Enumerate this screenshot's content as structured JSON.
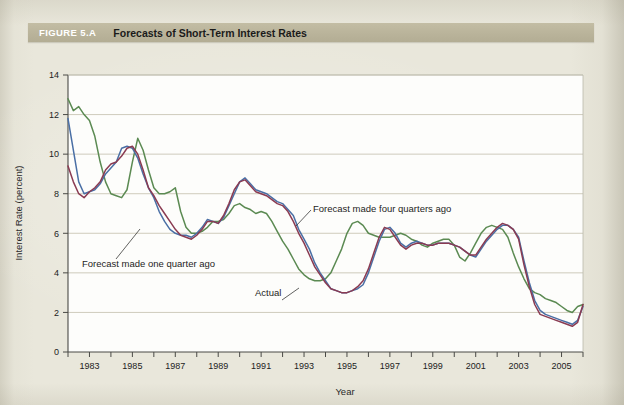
{
  "figure": {
    "number": "FIGURE 5.A",
    "title": "Forecasts of Short-Term Interest Rates"
  },
  "chart_data": {
    "type": "line",
    "title": "Forecasts of Short-Term Interest Rates",
    "xlabel": "Year",
    "ylabel": "Interest Rate (percent)",
    "xlim": [
      1982.0,
      2006.0
    ],
    "ylim": [
      0,
      14
    ],
    "yticks": [
      0,
      2,
      4,
      6,
      8,
      10,
      12,
      14
    ],
    "xticks": [
      1982,
      1983,
      1984,
      1985,
      1986,
      1987,
      1988,
      1989,
      1990,
      1991,
      1992,
      1993,
      1994,
      1995,
      1996,
      1997,
      1998,
      1999,
      2000,
      2001,
      2002,
      2003,
      2004,
      2005,
      2006
    ],
    "xticklabels": [
      "",
      "1983",
      "",
      "1985",
      "",
      "1987",
      "",
      "1989",
      "",
      "1991",
      "",
      "1993",
      "",
      "1995",
      "",
      "1997",
      "",
      "1999",
      "",
      "2001",
      "",
      "2003",
      "",
      "2005",
      ""
    ],
    "grid": "horizontal",
    "legend_position": "inline-annotations",
    "x_start": 1982.0,
    "x_step": 0.25,
    "series": [
      {
        "name": "Forecast made four quarters ago",
        "color": "#5b8a52",
        "values": [
          12.8,
          12.2,
          12.4,
          12.0,
          11.7,
          10.9,
          9.6,
          8.6,
          8.0,
          7.9,
          7.8,
          8.2,
          9.6,
          10.8,
          10.2,
          9.2,
          8.3,
          8.0,
          8.0,
          8.1,
          8.3,
          7.1,
          6.3,
          6.0,
          6.0,
          6.1,
          6.3,
          6.6,
          6.6,
          6.7,
          7.0,
          7.4,
          7.5,
          7.3,
          7.2,
          7.0,
          7.1,
          7.0,
          6.6,
          6.1,
          5.6,
          5.2,
          4.7,
          4.2,
          3.9,
          3.7,
          3.6,
          3.6,
          3.7,
          4.0,
          4.6,
          5.2,
          6.0,
          6.5,
          6.6,
          6.4,
          6.0,
          5.9,
          5.8,
          5.8,
          5.8,
          5.9,
          6.0,
          5.9,
          5.7,
          5.6,
          5.4,
          5.3,
          5.5,
          5.6,
          5.7,
          5.7,
          5.4,
          4.8,
          4.6,
          5.0,
          5.5,
          6.0,
          6.3,
          6.4,
          6.3,
          6.2,
          5.8,
          5.0,
          4.3,
          3.7,
          3.2,
          3.0,
          2.9,
          2.7,
          2.6,
          2.5,
          2.3,
          2.1,
          2.0,
          2.3,
          2.4
        ]
      },
      {
        "name": "Forecast made one quarter ago",
        "color": "#4a6fa5",
        "values": [
          11.8,
          10.2,
          8.6,
          8.0,
          8.1,
          8.2,
          8.5,
          9.0,
          9.3,
          9.6,
          10.3,
          10.4,
          10.3,
          9.8,
          9.0,
          8.3,
          7.8,
          7.1,
          6.6,
          6.2,
          6.0,
          5.9,
          5.9,
          5.8,
          6.0,
          6.3,
          6.7,
          6.6,
          6.5,
          6.8,
          7.4,
          8.0,
          8.6,
          8.8,
          8.5,
          8.2,
          8.1,
          8.0,
          7.8,
          7.6,
          7.5,
          7.2,
          6.9,
          6.2,
          5.7,
          5.2,
          4.5,
          4.0,
          3.6,
          3.2,
          3.1,
          3.0,
          3.0,
          3.1,
          3.2,
          3.4,
          4.0,
          4.8,
          5.6,
          6.2,
          6.3,
          6.0,
          5.5,
          5.3,
          5.5,
          5.6,
          5.5,
          5.4,
          5.4,
          5.5,
          5.5,
          5.5,
          5.4,
          5.3,
          5.1,
          4.9,
          4.8,
          5.2,
          5.6,
          5.9,
          6.2,
          6.4,
          6.4,
          6.2,
          5.8,
          4.6,
          3.5,
          2.6,
          2.1,
          1.9,
          1.8,
          1.7,
          1.6,
          1.5,
          1.4,
          1.6,
          2.3
        ]
      },
      {
        "name": "Actual",
        "color": "#8a3b52",
        "values": [
          9.4,
          8.6,
          8.0,
          7.8,
          8.1,
          8.3,
          8.6,
          9.2,
          9.5,
          9.6,
          9.9,
          10.3,
          10.4,
          10.0,
          9.2,
          8.3,
          7.9,
          7.4,
          7.0,
          6.6,
          6.2,
          5.9,
          5.8,
          5.7,
          5.9,
          6.2,
          6.6,
          6.6,
          6.5,
          6.9,
          7.5,
          8.2,
          8.6,
          8.7,
          8.4,
          8.1,
          8.0,
          7.9,
          7.7,
          7.5,
          7.4,
          7.1,
          6.6,
          6.0,
          5.5,
          4.9,
          4.3,
          3.9,
          3.5,
          3.2,
          3.1,
          3.0,
          3.0,
          3.1,
          3.3,
          3.6,
          4.2,
          5.0,
          5.8,
          6.3,
          6.2,
          5.8,
          5.4,
          5.2,
          5.4,
          5.5,
          5.5,
          5.4,
          5.4,
          5.5,
          5.5,
          5.5,
          5.4,
          5.3,
          5.1,
          4.9,
          4.9,
          5.3,
          5.7,
          6.0,
          6.3,
          6.5,
          6.4,
          6.2,
          5.7,
          4.4,
          3.3,
          2.4,
          1.9,
          1.8,
          1.7,
          1.6,
          1.5,
          1.4,
          1.3,
          1.5,
          2.4
        ]
      }
    ],
    "annotations": [
      {
        "text": "Forecast made four quarters ago",
        "label_x": 313,
        "label_y": 212,
        "leader": [
          296,
          226,
          311,
          210
        ]
      },
      {
        "text": "Forecast made one quarter ago",
        "label_x": 82,
        "label_y": 267,
        "leader": [
          140,
          229,
          116,
          259
        ]
      },
      {
        "text": "Actual",
        "label_x": 255,
        "label_y": 296,
        "leader": [
          282,
          300,
          299,
          288
        ]
      }
    ]
  }
}
